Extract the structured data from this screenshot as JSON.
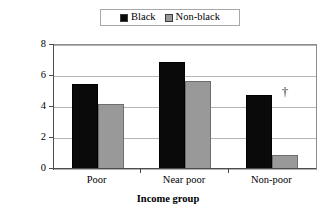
{
  "chart_data": {
    "type": "bar",
    "title": "",
    "categories": [
      "Poor",
      "Near poor",
      "Non-poor"
    ],
    "series": [
      {
        "name": "Black",
        "values": [
          5.5,
          6.9,
          4.8
        ],
        "color": "#0a0a0a"
      },
      {
        "name": "Non-black",
        "values": [
          4.2,
          5.7,
          0.9
        ],
        "color": "#999999"
      }
    ],
    "xlabel": "Income group",
    "ylabel": "Relative odds",
    "ylim": [
      0,
      8
    ],
    "yticks": [
      0,
      2,
      4,
      6,
      8
    ],
    "ytick_labels": [
      "0",
      "2",
      "4",
      "6",
      "8"
    ],
    "grid": true,
    "legend_position": "top-center",
    "annotations": [
      {
        "symbol": "†",
        "category": "Non-poor",
        "series": "Non-black",
        "x_value": 2.62,
        "y_value": 5.35
      }
    ]
  },
  "legend": {
    "entries": [
      {
        "label": "Black",
        "swatch": "black-swatch"
      },
      {
        "label": "Non-black",
        "swatch": "nonblack-swatch"
      }
    ]
  },
  "axes": {
    "y_title": "Relative odds",
    "x_title": "Income group"
  },
  "colors": {
    "black_series": "#0a0a0a",
    "nonblack_series": "#999999",
    "gridline": "#b4b4b4",
    "axis": "#4d4d4d",
    "frame": "#8c8c8c",
    "background": "#ffffff"
  }
}
